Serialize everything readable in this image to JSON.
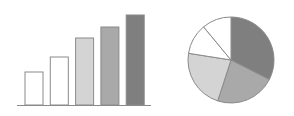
{
  "chart_data": [
    {
      "type": "bar",
      "title": "",
      "xlabel": "",
      "ylabel": "",
      "categories": [
        "1",
        "2",
        "3",
        "4",
        "5"
      ],
      "values": [
        33,
        48,
        67,
        78,
        90
      ],
      "ylim": [
        0,
        100
      ],
      "grid": false,
      "colors": [
        "#ffffff",
        "#ffffff",
        "#d4d4d4",
        "#a9a9a9",
        "#7f7f7f"
      ]
    },
    {
      "type": "pie",
      "title": "",
      "labels": [
        "A",
        "B",
        "C",
        "D",
        "E"
      ],
      "values": [
        32.5,
        22.5,
        22.5,
        11.5,
        11
      ],
      "colors": [
        "#7f7f7f",
        "#a9a9a9",
        "#d4d4d4",
        "#ffffff",
        "#ffffff"
      ],
      "start_angle_deg": 0,
      "direction": "clockwise"
    }
  ]
}
